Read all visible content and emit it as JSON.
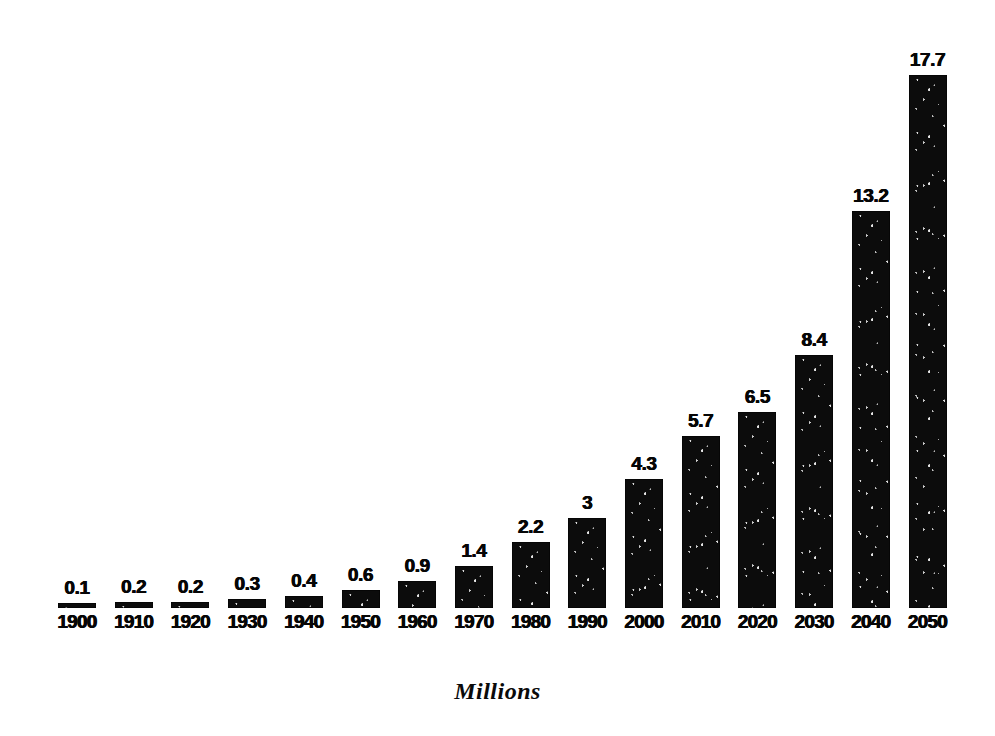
{
  "chart_data": {
    "type": "bar",
    "title": "",
    "subtitle": "",
    "xlabel": "",
    "ylabel": "",
    "caption": "Millions",
    "grid": false,
    "legend": "none",
    "axis_visible": false,
    "value_labels_shown": true,
    "ylim": [
      0,
      17.7
    ],
    "bar_color": "#0c0c0c",
    "text_color": "#060606",
    "background_color": "#ffffff",
    "categories": [
      "1900",
      "1910",
      "1920",
      "1930",
      "1940",
      "1950",
      "1960",
      "1970",
      "1980",
      "1990",
      "2000",
      "2010",
      "2020",
      "2030",
      "2040",
      "2050"
    ],
    "values": [
      0.1,
      0.2,
      0.2,
      0.3,
      0.4,
      0.6,
      0.9,
      1.4,
      2.2,
      3,
      4.3,
      5.7,
      6.5,
      8.4,
      13.2,
      17.7
    ],
    "value_labels": [
      "0.1",
      "0.2",
      "0.2",
      "0.3",
      "0.4",
      "0.6",
      "0.9",
      "1.4",
      "2.2",
      "3",
      "4.3",
      "5.7",
      "6.5",
      "8.4",
      "13.2",
      "17.7"
    ]
  },
  "chart": {
    "bars": [
      {
        "year": "1900",
        "value_label": "0.1",
        "value": 0.1
      },
      {
        "year": "1910",
        "value_label": "0.2",
        "value": 0.2
      },
      {
        "year": "1920",
        "value_label": "0.2",
        "value": 0.2
      },
      {
        "year": "1930",
        "value_label": "0.3",
        "value": 0.3
      },
      {
        "year": "1940",
        "value_label": "0.4",
        "value": 0.4
      },
      {
        "year": "1950",
        "value_label": "0.6",
        "value": 0.6
      },
      {
        "year": "1960",
        "value_label": "0.9",
        "value": 0.9
      },
      {
        "year": "1970",
        "value_label": "1.4",
        "value": 1.4
      },
      {
        "year": "1980",
        "value_label": "2.2",
        "value": 2.2
      },
      {
        "year": "1990",
        "value_label": "3",
        "value": 3
      },
      {
        "year": "2000",
        "value_label": "4.3",
        "value": 4.3
      },
      {
        "year": "2010",
        "value_label": "5.7",
        "value": 5.7
      },
      {
        "year": "2020",
        "value_label": "6.5",
        "value": 6.5
      },
      {
        "year": "2030",
        "value_label": "8.4",
        "value": 8.4
      },
      {
        "year": "2040",
        "value_label": "13.2",
        "value": 13.2
      },
      {
        "year": "2050",
        "value_label": "17.7",
        "value": 17.7
      }
    ],
    "caption": "Millions"
  },
  "layout": {
    "first_bar_left": 58,
    "bar_pitch": 56.7,
    "bar_width": 38,
    "baseline_y": 608,
    "pixels_per_unit": 30.1,
    "min_bar_height": 5
  }
}
